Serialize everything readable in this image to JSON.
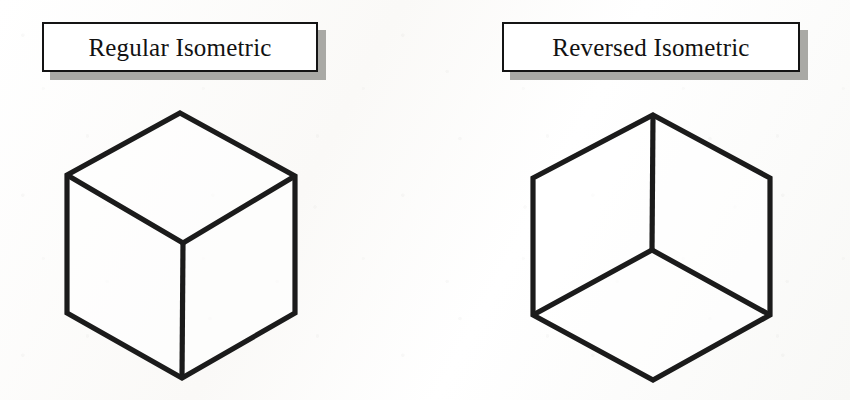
{
  "figure": {
    "background_color": "#fcfcfa",
    "width": 850,
    "height": 400
  },
  "panels": [
    {
      "id": "regular",
      "label": "Regular Isometric",
      "box": {
        "x": 42,
        "y": 22,
        "width": 276,
        "height": 50
      },
      "shadow_offset": 8,
      "shadow_color": "#a9a9a5",
      "border_color": "#141414",
      "diagram": {
        "name": "regular-isometric-cube",
        "stroke_color": "#1b1b1b",
        "stroke_width": 5.2,
        "view": "above",
        "interior_junction_shape": "Y",
        "interior_junction": {
          "x": 183,
          "y": 243
        },
        "outline_vertices": [
          {
            "name": "top",
            "x": 180,
            "y": 113
          },
          {
            "name": "upper-right",
            "x": 295,
            "y": 176
          },
          {
            "name": "lower-right",
            "x": 295,
            "y": 313
          },
          {
            "name": "bottom",
            "x": 182,
            "y": 378
          },
          {
            "name": "lower-left",
            "x": 67,
            "y": 313
          },
          {
            "name": "upper-left",
            "x": 67,
            "y": 175
          }
        ],
        "interior_edges": [
          {
            "from": "interior-junction",
            "to": "upper-left"
          },
          {
            "from": "interior-junction",
            "to": "upper-right"
          },
          {
            "from": "interior-junction",
            "to": "bottom"
          }
        ],
        "visible_faces": [
          "top",
          "left",
          "right"
        ]
      }
    },
    {
      "id": "reversed",
      "label": "Reversed Isometric",
      "box": {
        "x": 502,
        "y": 22,
        "width": 298,
        "height": 50
      },
      "shadow_offset": 8,
      "shadow_color": "#a9a9a5",
      "border_color": "#141414",
      "diagram": {
        "name": "reversed-isometric-cube",
        "stroke_color": "#1b1b1b",
        "stroke_width": 5.2,
        "view": "below",
        "interior_junction_shape": "inverted-Y",
        "interior_junction": {
          "x": 652,
          "y": 250
        },
        "outline_vertices": [
          {
            "name": "top",
            "x": 653,
            "y": 115
          },
          {
            "name": "upper-right",
            "x": 770,
            "y": 178
          },
          {
            "name": "lower-right",
            "x": 770,
            "y": 315
          },
          {
            "name": "bottom",
            "x": 653,
            "y": 380
          },
          {
            "name": "lower-left",
            "x": 533,
            "y": 315
          },
          {
            "name": "upper-left",
            "x": 533,
            "y": 178
          }
        ],
        "interior_edges": [
          {
            "from": "interior-junction",
            "to": "top"
          },
          {
            "from": "interior-junction",
            "to": "lower-left"
          },
          {
            "from": "interior-junction",
            "to": "lower-right"
          }
        ],
        "visible_faces": [
          "bottom",
          "left",
          "right"
        ]
      }
    }
  ]
}
